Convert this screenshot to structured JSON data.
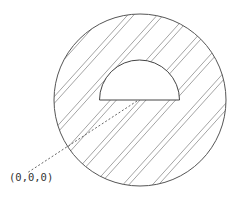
{
  "diagram": {
    "outer_circle": {
      "cx": 140,
      "cy": 100,
      "r": 86,
      "stroke": "#555555",
      "fill": "hatched"
    },
    "inner_hemisphere": {
      "cx": 139.5,
      "cy": 100,
      "r": 40,
      "orientation": "dome-up",
      "fill": "#ffffff",
      "stroke": "#444444"
    },
    "hatching": {
      "color": "#9a9a9a",
      "angle_deg": 48,
      "pattern": "paired-lines",
      "pair_gap": 4.5,
      "period": 22
    },
    "dashed_leader": {
      "x1": 137,
      "y1": 101,
      "x2": 27,
      "y2": 173,
      "color": "#555555"
    },
    "origin_label": {
      "text": "(0,0,0)",
      "x": 9,
      "y": 181
    }
  }
}
